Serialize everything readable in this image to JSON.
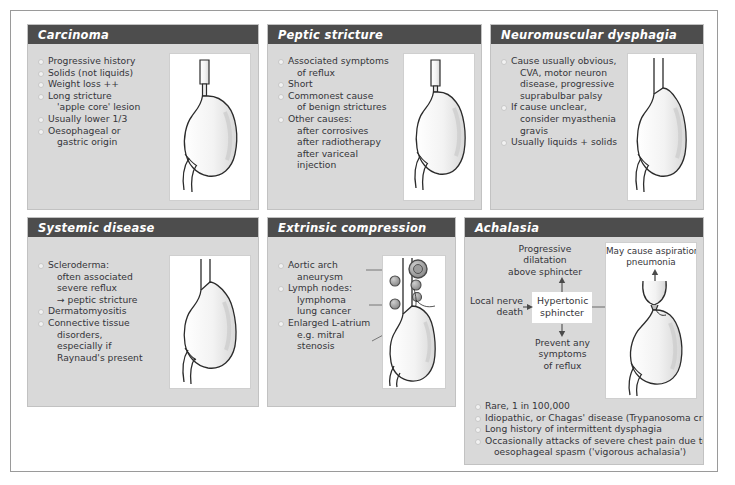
{
  "panels": [
    {
      "id": "carcinoma",
      "title": "Carcinoma",
      "bullets": [
        {
          "text": "Progressive history",
          "type": "bullet"
        },
        {
          "text": "Solids (not liquids)",
          "type": "bullet"
        },
        {
          "text": "Weight loss ++",
          "type": "bullet"
        },
        {
          "text": "Long stricture",
          "type": "bullet"
        },
        {
          "text": "'apple core' lesion",
          "type": "cont"
        },
        {
          "text": "Usually lower 1/3",
          "type": "bullet"
        },
        {
          "text": "Oesophageal or",
          "type": "bullet"
        },
        {
          "text": "gastric origin",
          "type": "cont"
        }
      ],
      "figure": "stomach-carcinoma-stricture"
    },
    {
      "id": "peptic-stricture",
      "title": "Peptic stricture",
      "bullets": [
        {
          "text": "Associated symptoms",
          "type": "bullet"
        },
        {
          "text": "of reflux",
          "type": "cont"
        },
        {
          "text": "Short",
          "type": "bullet"
        },
        {
          "text": "Commonest cause",
          "type": "bullet"
        },
        {
          "text": "of benign strictures",
          "type": "cont"
        },
        {
          "text": "Other causes:",
          "type": "bullet"
        },
        {
          "text": "after corrosives",
          "type": "cont"
        },
        {
          "text": "after radiotherapy",
          "type": "cont"
        },
        {
          "text": "after variceal",
          "type": "cont"
        },
        {
          "text": "injection",
          "type": "cont"
        }
      ],
      "figure": "stomach-peptic-stricture"
    },
    {
      "id": "neuromuscular-dysphagia",
      "title": "Neuromuscular dysphagia",
      "bullets": [
        {
          "text": "Cause usually obvious,",
          "type": "bullet"
        },
        {
          "text": "CVA, motor neuron",
          "type": "cont"
        },
        {
          "text": "disease, progressive",
          "type": "cont"
        },
        {
          "text": "suprabulbar palsy",
          "type": "cont"
        },
        {
          "text": "If cause unclear,",
          "type": "bullet"
        },
        {
          "text": "consider myasthenia",
          "type": "cont"
        },
        {
          "text": "gravis",
          "type": "cont"
        },
        {
          "text": "Usually liquids + solids",
          "type": "bullet"
        }
      ],
      "figure": "stomach-normal-oesophagus"
    },
    {
      "id": "systemic-disease",
      "title": "Systemic disease",
      "bullets": [
        {
          "text": "Scleroderma:",
          "type": "bullet"
        },
        {
          "text": "often associated",
          "type": "cont"
        },
        {
          "text": "severe reflux",
          "type": "cont"
        },
        {
          "text": "→ peptic stricture",
          "type": "cont"
        },
        {
          "text": "Dermatomyositis",
          "type": "bullet"
        },
        {
          "text": "Connective tissue",
          "type": "bullet"
        },
        {
          "text": "disorders,",
          "type": "cont"
        },
        {
          "text": "especially if",
          "type": "cont"
        },
        {
          "text": "Raynaud's present",
          "type": "cont"
        }
      ],
      "figure": "stomach-dilated-oesophagus"
    },
    {
      "id": "extrinsic-compression",
      "title": "Extrinsic compression",
      "bullets": [
        {
          "text": "Aortic arch",
          "type": "bullet"
        },
        {
          "text": "aneurysm",
          "type": "cont"
        },
        {
          "text": "Lymph nodes:",
          "type": "bullet"
        },
        {
          "text": "lymphoma",
          "type": "cont"
        },
        {
          "text": "lung cancer",
          "type": "cont"
        },
        {
          "text": "Enlarged L-atrium",
          "type": "bullet"
        },
        {
          "text": "e.g. mitral",
          "type": "cont"
        },
        {
          "text": "stenosis",
          "type": "cont"
        }
      ],
      "figure": "stomach-extrinsic-compression-nodes"
    },
    {
      "id": "achalasia",
      "title": "Achalasia",
      "flow": {
        "top_label": "Progressive\ndilatation\nabove sphincter",
        "left_label": "Local nerve\ndeath",
        "center_box": "Hypertonic\nsphincter",
        "bottom_label": "Prevent any\nsymptoms\nof reflux",
        "figure_caption": "May cause aspiration\npneumonia"
      },
      "bullets": [
        {
          "text": "Rare, 1 in 100,000",
          "type": "bullet"
        },
        {
          "text": "Idiopathic, or Chagas' disease (Trypanosoma cruzi)",
          "type": "bullet"
        },
        {
          "text": "Long history of intermittent dysphagia",
          "type": "bullet"
        },
        {
          "text": "Occasionally attacks of severe chest pain due to",
          "type": "bullet"
        },
        {
          "text": "oesophageal spasm ('vigorous achalasia')",
          "type": "cont"
        }
      ],
      "figure": "stomach-achalasia-birds-beak"
    }
  ],
  "colors": {
    "header_bar": "#4d4d4d",
    "panel_background": "#d9d9d9",
    "figure_background": "#ffffff",
    "text": "#35353a",
    "page_background": "#ffffff",
    "node_fill": "#8f8f8f"
  }
}
